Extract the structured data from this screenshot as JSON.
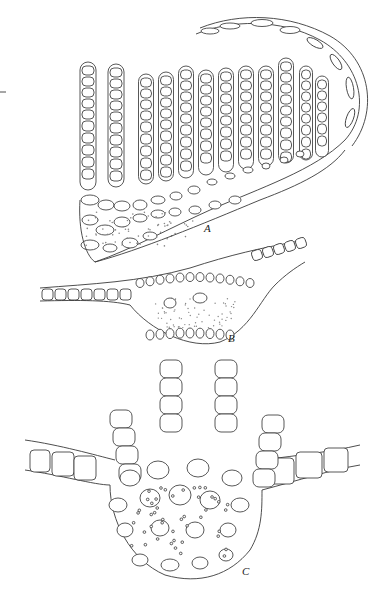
{
  "figure": {
    "type": "botanical anatomical line drawing",
    "panels": [
      {
        "id": "A",
        "label": "A",
        "description": "cross-section with many uniseriate filaments/lamellae rising from a curved base, enclosed by a curved margin"
      },
      {
        "id": "B",
        "label": "B",
        "description": "cross-section of lens-shaped midrib with one-cell-thick lamina extending both sides"
      },
      {
        "id": "C",
        "label": "C",
        "description": "cross-section of midrib bearing four short filaments, lamina extending both sides"
      }
    ],
    "colors": {
      "line": "#3a3a3a",
      "background": "#ffffff"
    }
  }
}
